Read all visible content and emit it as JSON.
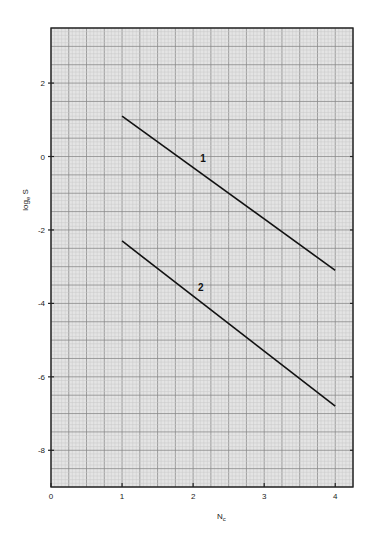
{
  "chart_data": {
    "type": "line",
    "title": "",
    "xlabel": "N",
    "xlabel_sub": "c",
    "ylabel": "log",
    "ylabel_sub": "e",
    "ylabel_suffix": " S",
    "xlim": [
      0,
      4.25
    ],
    "ylim": [
      -9,
      3.5
    ],
    "xticks": [
      0,
      1,
      2,
      3,
      4
    ],
    "xtick_labels": [
      "0",
      "1",
      "2",
      "3",
      "4"
    ],
    "yticks": [
      2,
      0,
      -2,
      -4,
      -6,
      -8
    ],
    "ytick_labels": [
      "2",
      "0",
      "-2",
      "-4",
      "-6",
      "-8"
    ],
    "grid": true,
    "legend": null,
    "series": [
      {
        "name": "1",
        "x": [
          1,
          4
        ],
        "y": [
          1.1,
          -3.1
        ],
        "label_pos": [
          2.1,
          -0.15
        ]
      },
      {
        "name": "2",
        "x": [
          1,
          4
        ],
        "y": [
          -2.3,
          -6.8
        ],
        "label_pos": [
          2.07,
          -3.65
        ]
      }
    ]
  },
  "colors": {
    "grid_fine": "#c8c8c8",
    "grid_major": "#8a8a8a",
    "frame": "#222222",
    "line": "#111111",
    "paper": "#e4e4e4"
  }
}
